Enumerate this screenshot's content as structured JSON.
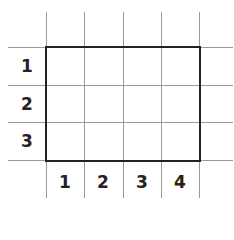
{
  "diagram": {
    "type": "grid-with-rectangle",
    "rows": 3,
    "columns": 4,
    "row_labels": [
      "1",
      "2",
      "3"
    ],
    "column_labels": [
      "1",
      "2",
      "3",
      "4"
    ],
    "rectangle": {
      "from_col": 1,
      "to_col": 4,
      "from_row": 1,
      "to_row": 3,
      "border_color": "#222222"
    },
    "grid_color": "#9a9a9a"
  }
}
